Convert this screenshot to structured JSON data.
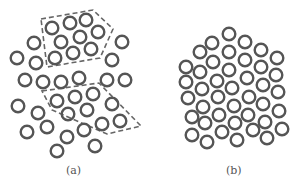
{
  "figure": {
    "panels": [
      {
        "id": "a",
        "label": "(a)",
        "label_pos": [
          66,
          164
        ],
        "description": "Disordered arrangement of rings with two dashed-outlined ordered domains",
        "domains": [
          {
            "name": "upper-domain",
            "points": [
              [
                41,
                19
              ],
              [
                93,
                10
              ],
              [
                113,
                29
              ],
              [
                100,
                58
              ],
              [
                47,
                67
              ]
            ]
          },
          {
            "name": "lower-domain",
            "points": [
              [
                42,
                91
              ],
              [
                99,
                83
              ],
              [
                141,
                126
              ],
              [
                107,
                134
              ],
              [
                52,
                110
              ]
            ]
          }
        ],
        "circles": [
          [
            52,
            28
          ],
          [
            70,
            23
          ],
          [
            86,
            20
          ],
          [
            61,
            42
          ],
          [
            80,
            37
          ],
          [
            98,
            32
          ],
          [
            55,
            58
          ],
          [
            73,
            53
          ],
          [
            91,
            49
          ],
          [
            34,
            43
          ],
          [
            17,
            58
          ],
          [
            36,
            63
          ],
          [
            122,
            42
          ],
          [
            112,
            60
          ],
          [
            25,
            80
          ],
          [
            43,
            82
          ],
          [
            61,
            82
          ],
          [
            79,
            78
          ],
          [
            107,
            80
          ],
          [
            125,
            80
          ],
          [
            57,
            101
          ],
          [
            75,
            97
          ],
          [
            93,
            94
          ],
          [
            112,
            104
          ],
          [
            18,
            106
          ],
          [
            38,
            113
          ],
          [
            68,
            114
          ],
          [
            87,
            110
          ],
          [
            120,
            121
          ],
          [
            27,
            132
          ],
          [
            47,
            127
          ],
          [
            67,
            137
          ],
          [
            84,
            130
          ],
          [
            102,
            124
          ],
          [
            95,
            146
          ],
          [
            57,
            151
          ]
        ]
      },
      {
        "id": "b",
        "label": "(b)",
        "label_pos": [
          226,
          164
        ],
        "description": "Densely packed disordered arrangement of rings",
        "circles": [
          [
            229,
            34
          ],
          [
            212,
            43
          ],
          [
            245,
            42
          ],
          [
            200,
            52
          ],
          [
            229,
            52
          ],
          [
            261,
            50
          ],
          [
            186,
            67
          ],
          [
            213,
            62
          ],
          [
            245,
            60
          ],
          [
            277,
            58
          ],
          [
            200,
            72
          ],
          [
            229,
            70
          ],
          [
            261,
            67
          ],
          [
            186,
            82
          ],
          [
            217,
            81
          ],
          [
            247,
            78
          ],
          [
            276,
            75
          ],
          [
            202,
            89
          ],
          [
            232,
            88
          ],
          [
            263,
            85
          ],
          [
            188,
            98
          ],
          [
            218,
            97
          ],
          [
            249,
            97
          ],
          [
            278,
            92
          ],
          [
            203,
            107
          ],
          [
            234,
            106
          ],
          [
            263,
            104
          ],
          [
            192,
            117
          ],
          [
            219,
            115
          ],
          [
            248,
            115
          ],
          [
            279,
            111
          ],
          [
            205,
            123
          ],
          [
            235,
            123
          ],
          [
            265,
            122
          ],
          [
            192,
            135
          ],
          [
            222,
            132
          ],
          [
            253,
            130
          ],
          [
            282,
            129
          ],
          [
            207,
            142
          ],
          [
            237,
            140
          ],
          [
            267,
            138
          ]
        ]
      }
    ],
    "style": {
      "ring_radius": 6.3,
      "ring_stroke": 2.4,
      "ring_color": "#555555",
      "dash_color": "#666666"
    }
  }
}
